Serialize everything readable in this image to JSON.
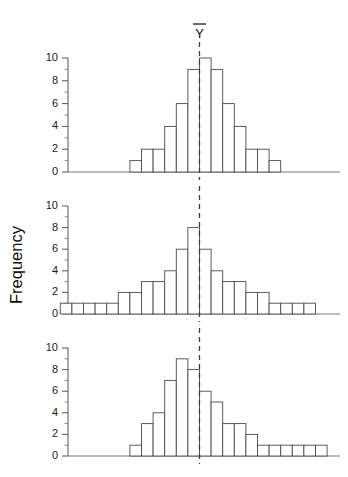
{
  "figure": {
    "background_color": "#ffffff",
    "bar_stroke_color": "#4a4a4a",
    "axis_color": "#555555",
    "mean_line_color": "#3b3b3b",
    "mean_label": "Y",
    "mean_label_name": "y-bar",
    "y_axis_title": "Frequency",
    "y_tick_labels": [
      "0",
      "2",
      "4",
      "6",
      "8",
      "10"
    ],
    "panel_count": 3
  },
  "chart_data": [
    {
      "type": "bar",
      "title": "",
      "subtitle": "top histogram - symmetric distribution, mean at mode",
      "xlabel": "",
      "ylabel": "Frequency",
      "ylim": [
        0,
        10
      ],
      "yticks": [
        0,
        2,
        4,
        6,
        8,
        10
      ],
      "grid": false,
      "legend": "none",
      "categories": [
        "1",
        "2",
        "3",
        "4",
        "5",
        "6",
        "7",
        "8",
        "9",
        "10",
        "11",
        "12",
        "13"
      ],
      "values": [
        1,
        2,
        2,
        4,
        6,
        9,
        10,
        9,
        6,
        4,
        2,
        2,
        1
      ],
      "annotations": [
        {
          "label": "Y",
          "type": "vertical-dashed-line",
          "at_bin_boundary": 6,
          "note": "mean marker, centered at the distribution centre"
        }
      ]
    },
    {
      "type": "bar",
      "title": "",
      "subtitle": "middle histogram - symmetric distribution with broader tails",
      "xlabel": "",
      "ylabel": "Frequency",
      "ylim": [
        0,
        10
      ],
      "yticks": [
        0,
        2,
        4,
        6,
        8,
        10
      ],
      "grid": false,
      "legend": "none",
      "categories": [
        "1",
        "2",
        "3",
        "4",
        "5",
        "6",
        "7",
        "8",
        "9",
        "10",
        "11",
        "12",
        "13",
        "14",
        "15",
        "16",
        "17",
        "18",
        "19",
        "20",
        "21",
        "22"
      ],
      "values": [
        1,
        1,
        1,
        1,
        1,
        2,
        2,
        3,
        3,
        4,
        6,
        8,
        6,
        4,
        3,
        3,
        2,
        2,
        1,
        1,
        1,
        1
      ],
      "annotations": [
        {
          "label": "Y",
          "type": "vertical-dashed-line",
          "at_bin_boundary": 12,
          "note": "mean marker, centered at the distribution centre"
        }
      ]
    },
    {
      "type": "bar",
      "title": "",
      "subtitle": "bottom histogram - right-skewed distribution, mean right of mode",
      "xlabel": "",
      "ylabel": "Frequency",
      "ylim": [
        0,
        10
      ],
      "yticks": [
        0,
        2,
        4,
        6,
        8,
        10
      ],
      "grid": false,
      "legend": "none",
      "categories": [
        "1",
        "2",
        "3",
        "4",
        "5",
        "6",
        "7",
        "8",
        "9",
        "10",
        "11",
        "12",
        "13",
        "14",
        "15",
        "16",
        "17"
      ],
      "values": [
        1,
        3,
        4,
        7,
        9,
        8,
        6,
        5,
        3,
        3,
        2,
        1,
        1,
        1,
        1,
        1,
        1
      ],
      "annotations": [
        {
          "label": "Y",
          "type": "vertical-dashed-line",
          "at_bin_boundary": 6,
          "note": "mean marker, pulled right of the mode by the long right tail"
        }
      ]
    }
  ]
}
